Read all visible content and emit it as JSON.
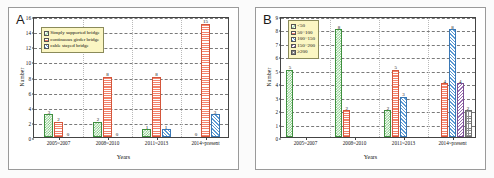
{
  "figure": {
    "panels": [
      {
        "letter": "A",
        "ylabel": "Number",
        "xlabel": "Years",
        "legend": [
          {
            "label": "Simply supported bridge",
            "pattern": "p-green"
          },
          {
            "label": "continuous girder bridge",
            "pattern": "p-orange"
          },
          {
            "label": "cable stayed bridge",
            "pattern": "p-blue"
          }
        ]
      },
      {
        "letter": "B",
        "ylabel": "Number",
        "xlabel": "Years",
        "legend": [
          {
            "label": "<50",
            "pattern": "p-green"
          },
          {
            "label": "50~100",
            "pattern": "p-orange"
          },
          {
            "label": "100~150",
            "pattern": "p-blue"
          },
          {
            "label": "150~200",
            "pattern": "p-purple"
          },
          {
            "label": "≥200",
            "pattern": "p-gray"
          }
        ]
      }
    ]
  },
  "chart_data": [
    {
      "type": "bar",
      "panel": "A",
      "title": "",
      "xlabel": "Years",
      "ylabel": "Number",
      "categories": [
        "2005~2007",
        "2008~2010",
        "2011~2013",
        "2014~present"
      ],
      "ylim": [
        0,
        16
      ],
      "yticks": [
        0,
        2,
        4,
        6,
        8,
        10,
        12,
        14,
        16
      ],
      "grid": true,
      "legend_position": "upper-left-inside",
      "series": [
        {
          "name": "Simply supported bridge",
          "pattern": "p-green",
          "values": [
            3,
            2,
            1,
            0
          ]
        },
        {
          "name": "continuous girder bridge",
          "pattern": "p-orange",
          "values": [
            2,
            8,
            8,
            15
          ]
        },
        {
          "name": "cable stayed bridge",
          "pattern": "p-blue",
          "values": [
            0,
            0,
            1,
            3
          ]
        }
      ]
    },
    {
      "type": "bar",
      "panel": "B",
      "title": "",
      "xlabel": "Years",
      "ylabel": "Number",
      "categories": [
        "2005~2007",
        "2008~2010",
        "2011~2013",
        "2014~present"
      ],
      "ylim": [
        0,
        9
      ],
      "yticks": [
        0,
        1,
        2,
        3,
        4,
        5,
        6,
        7,
        8,
        9
      ],
      "grid": true,
      "legend_position": "upper-left-inside",
      "series": [
        {
          "name": "<50",
          "pattern": "p-green",
          "values": [
            5,
            8,
            2,
            0
          ]
        },
        {
          "name": "50~100",
          "pattern": "p-orange",
          "values": [
            0,
            2,
            5,
            4
          ]
        },
        {
          "name": "100~150",
          "pattern": "p-blue",
          "values": [
            0,
            0,
            3,
            8
          ]
        },
        {
          "name": "150~200",
          "pattern": "p-purple",
          "values": [
            0,
            0,
            0,
            4
          ]
        },
        {
          "name": "≥200",
          "pattern": "p-gray",
          "values": [
            0,
            0,
            0,
            2
          ]
        }
      ]
    }
  ]
}
